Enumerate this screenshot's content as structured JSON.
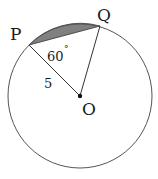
{
  "diagram": {
    "points": {
      "P": {
        "label": "P"
      },
      "Q": {
        "label": "Q"
      },
      "O": {
        "label": "O"
      }
    },
    "angle_label": "60",
    "angle_degree_symbol": "°",
    "radius_label": "5",
    "colors": {
      "circle": "#555555",
      "segment_fill": "#808080",
      "lines": "#333333"
    }
  }
}
